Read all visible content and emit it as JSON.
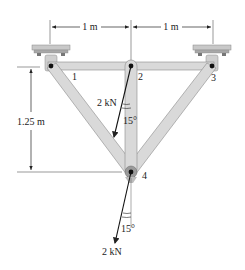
{
  "diagram": {
    "type": "truss-structure",
    "dimensions": {
      "top_left_span": "1 m",
      "top_right_span": "1 m",
      "height": "1.25 m"
    },
    "joints": [
      {
        "id": "1",
        "label": "1"
      },
      {
        "id": "2",
        "label": "2"
      },
      {
        "id": "3",
        "label": "3"
      },
      {
        "id": "4",
        "label": "4"
      }
    ],
    "loads": [
      {
        "at_joint": "2",
        "magnitude": "2 kN",
        "angle": "15°"
      },
      {
        "at_joint": "4",
        "magnitude": "2 kN",
        "angle": "15°"
      }
    ],
    "colors": {
      "member_fill": "#d9d9d9",
      "member_stroke": "#8a8a8a",
      "support_fill": "#c8c8c8",
      "line": "#222222"
    }
  }
}
